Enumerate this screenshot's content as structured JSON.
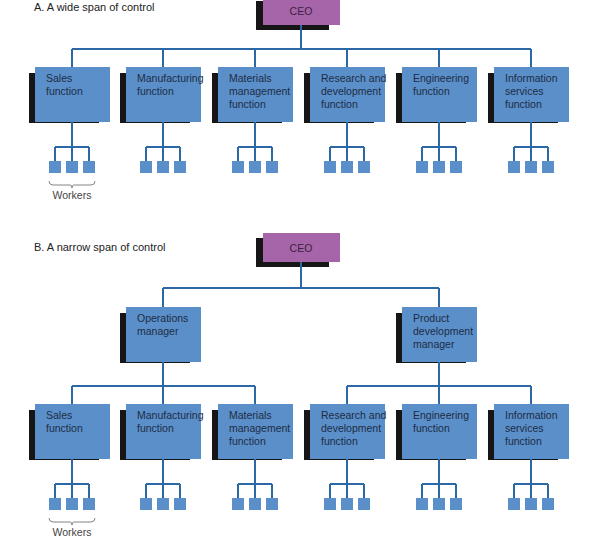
{
  "colors": {
    "function_box": "#5b8fca",
    "ceo_box": "#a665a9",
    "shadow": "#161616",
    "connector": "#2d68a6",
    "worker": "#5b8fca"
  },
  "sectionA": {
    "title": "A.  A wide span of control",
    "ceo": "CEO",
    "functions": [
      {
        "lines": [
          "Sales",
          "function"
        ]
      },
      {
        "lines": [
          "Manufacturing",
          "function"
        ]
      },
      {
        "lines": [
          "Materials",
          "management",
          "function"
        ]
      },
      {
        "lines": [
          "Research and",
          "development",
          "function"
        ]
      },
      {
        "lines": [
          "Engineering",
          "function"
        ]
      },
      {
        "lines": [
          "Information",
          "services",
          "function"
        ]
      }
    ],
    "workers_per_function": 3,
    "workers_label": "Workers"
  },
  "sectionB": {
    "title": "B.  A narrow span of control",
    "ceo": "CEO",
    "managers": [
      {
        "lines": [
          "Operations",
          "manager"
        ],
        "functions": [
          {
            "lines": [
              "Sales",
              "function"
            ]
          },
          {
            "lines": [
              "Manufacturing",
              "function"
            ]
          },
          {
            "lines": [
              "Materials",
              "management",
              "function"
            ]
          }
        ]
      },
      {
        "lines": [
          "Product",
          "development",
          "manager"
        ],
        "functions": [
          {
            "lines": [
              "Research and",
              "development",
              "function"
            ]
          },
          {
            "lines": [
              "Engineering",
              "function"
            ]
          },
          {
            "lines": [
              "Information",
              "services",
              "function"
            ]
          }
        ]
      }
    ],
    "workers_per_function": 3,
    "workers_label": "Workers"
  }
}
